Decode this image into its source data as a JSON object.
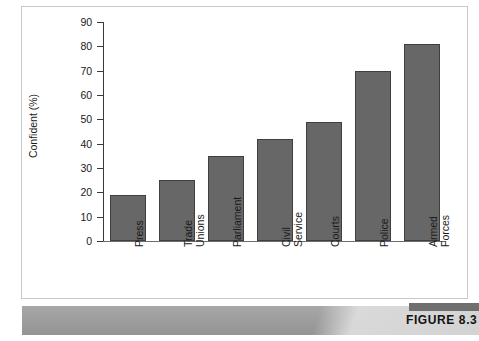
{
  "caption": {
    "title": "Trust in Political Institutions",
    "figure_tag": "FIGURE 8.3"
  },
  "colors": {
    "bar_fill": "#676767",
    "bar_border": "#3f3f3f",
    "axis": "#3a3a3a",
    "caption_bar": "#9d9d9d",
    "caption_text": "#ffffff",
    "figure_tag_block": "#6f6f6f"
  },
  "chart_data": {
    "type": "bar",
    "title": "",
    "xlabel": "",
    "ylabel": "Confident (%)",
    "ylim": [
      0,
      90
    ],
    "yticks": [
      0,
      10,
      20,
      30,
      40,
      50,
      60,
      70,
      80,
      90
    ],
    "ytick_labels": [
      "0",
      "10",
      "20",
      "30",
      "40",
      "50",
      "60",
      "70",
      "80",
      "90"
    ],
    "grid": false,
    "legend": false,
    "categories": [
      "Press",
      "Trade\nUnions",
      "Parliament",
      "Civil\nService",
      "Courts",
      "Police",
      "Armed\nForces"
    ],
    "values": [
      19,
      25,
      35,
      42,
      49,
      70,
      81
    ]
  }
}
